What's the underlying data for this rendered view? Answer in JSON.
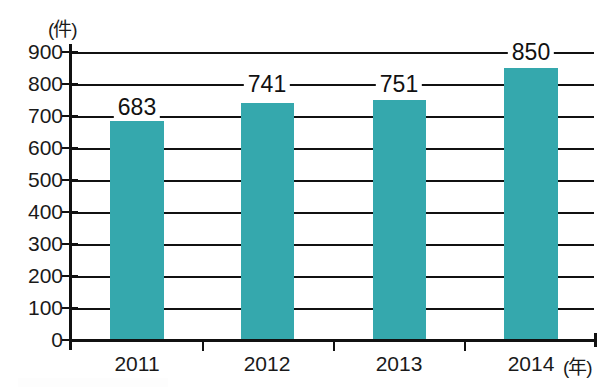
{
  "chart_data": {
    "type": "bar",
    "title": "",
    "subtitle": "",
    "categories": [
      "2011",
      "2012",
      "2013",
      "2014"
    ],
    "values": [
      683,
      741,
      751,
      850
    ],
    "series": [
      {
        "name": "件数",
        "values": [
          683,
          741,
          751,
          850
        ]
      }
    ],
    "xlabel": "(年)",
    "ylabel": "(件)",
    "ylim": [
      0,
      900
    ],
    "ytick_step": 100,
    "yticks": [
      "900",
      "800",
      "700",
      "600",
      "500",
      "400",
      "300",
      "200",
      "100",
      "0"
    ],
    "ytick_values": [
      900,
      800,
      700,
      600,
      500,
      400,
      300,
      200,
      100,
      0
    ],
    "grid": true,
    "grid_axis": "y",
    "legend": "none",
    "bar_color": "#35a8ad",
    "axis_color": "#111111",
    "text_color": "#1a1a1a",
    "background": "#ffffff",
    "data_labels": [
      "683",
      "741",
      "751",
      "850"
    ]
  },
  "axes": {
    "y_unit_label": "(件)",
    "x_unit_label": "(年)"
  }
}
